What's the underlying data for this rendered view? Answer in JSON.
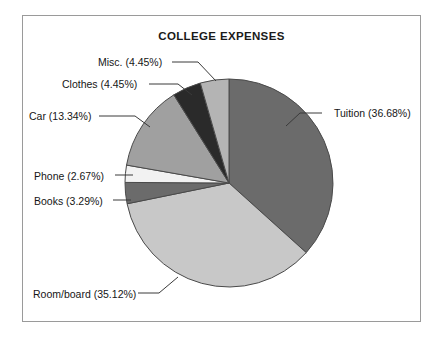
{
  "chart_data": {
    "type": "pie",
    "title": "COLLEGE EXPENSES",
    "xlabel": "",
    "ylabel": "",
    "legend_position": "callout-labels",
    "grid": false,
    "categories": [
      "Tuition",
      "Room/board",
      "Books",
      "Phone",
      "Car",
      "Clothes",
      "Misc."
    ],
    "values": [
      36.68,
      35.12,
      3.29,
      2.67,
      13.34,
      4.45,
      4.45
    ],
    "units": "percent",
    "start_angle_deg": 0,
    "direction": "clockwise",
    "slices": [
      {
        "name": "Tuition",
        "percent": 36.68,
        "label": "Tuition (36.68%)",
        "color": "#6b6b6b",
        "side": "right",
        "label_left": 334,
        "label_top": 108,
        "leader": [
          [
            322,
            113
          ],
          [
            300,
            113
          ],
          [
            286,
            126
          ]
        ]
      },
      {
        "name": "Room/board",
        "percent": 35.12,
        "label": "Room/board (35.12%)",
        "color": "#c8c8c8",
        "side": "left",
        "label_left": 33,
        "label_top": 289,
        "leader": [
          [
            138,
            293
          ],
          [
            159,
            293
          ],
          [
            178,
            277
          ]
        ]
      },
      {
        "name": "Books",
        "percent": 3.29,
        "label": "Books (3.29%)",
        "color": "#6b6b6b",
        "side": "left",
        "label_left": 34,
        "label_top": 196,
        "leader": [
          [
            113,
            200
          ],
          [
            131,
            200
          ]
        ]
      },
      {
        "name": "Phone",
        "percent": 2.67,
        "label": "Phone (2.67%)",
        "color": "#f2f2f2",
        "side": "left",
        "label_left": 34,
        "label_top": 171,
        "leader": [
          [
            115,
            175
          ],
          [
            133,
            175
          ]
        ]
      },
      {
        "name": "Car",
        "percent": 13.34,
        "label": "Car (13.34%)",
        "color": "#a0a0a0",
        "side": "left",
        "label_left": 29,
        "label_top": 111,
        "leader": [
          [
            99,
            116
          ],
          [
            135,
            116
          ],
          [
            150,
            127
          ]
        ]
      },
      {
        "name": "Clothes",
        "percent": 4.45,
        "label": "Clothes (4.45%)",
        "color": "#2a2a2a",
        "side": "left",
        "label_left": 62,
        "label_top": 79,
        "leader": [
          [
            149,
            84
          ],
          [
            178,
            84
          ],
          [
            192,
            95
          ]
        ]
      },
      {
        "name": "Misc.",
        "percent": 4.45,
        "label": "Misc. (4.45%)",
        "color": "#b4b4b4",
        "side": "left",
        "label_left": 98,
        "label_top": 57,
        "leader": [
          [
            172,
            62
          ],
          [
            198,
            62
          ],
          [
            216,
            81
          ]
        ]
      }
    ],
    "geometry": {
      "center_x": 229,
      "center_y": 183,
      "radius": 104
    },
    "colors": {
      "outline": "#4a4a4a",
      "frame": "#9a9a9a",
      "text": "#161616",
      "background": "#ffffff"
    }
  }
}
